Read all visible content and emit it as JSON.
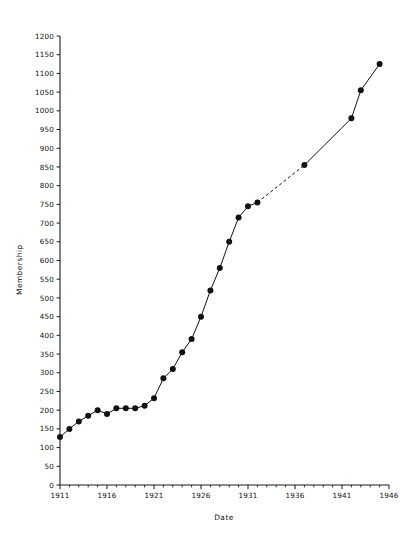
{
  "chart_data": {
    "type": "line",
    "title": "",
    "xlabel": "Date",
    "ylabel": "Membership",
    "xlim": [
      1911,
      1946
    ],
    "ylim": [
      0,
      1200
    ],
    "grid": false,
    "legend": null,
    "x_tick_step_major": 5,
    "x_tick_step_minor": 1,
    "y_tick_step_major": 50,
    "x_tick_labels": [
      "1911",
      "1916",
      "1921",
      "1926",
      "1931",
      "1936",
      "1941",
      "1946"
    ],
    "y_tick_labels": [
      "0",
      "50",
      "100",
      "150",
      "200",
      "250",
      "300",
      "350",
      "400",
      "450",
      "500",
      "550",
      "600",
      "650",
      "700",
      "750",
      "800",
      "850",
      "900",
      "950",
      "1000",
      "1050",
      "1100",
      "1150",
      "1200"
    ],
    "marker": "filled-circle",
    "line_color": "#111111",
    "marker_color": "#111111",
    "series": [
      {
        "name": "Membership",
        "x": [
          1911,
          1912,
          1913,
          1914,
          1915,
          1916,
          1917,
          1918,
          1919,
          1920,
          1921,
          1922,
          1923,
          1924,
          1925,
          1926,
          1927,
          1928,
          1929,
          1930,
          1931,
          1932,
          1937,
          1942,
          1943,
          1945
        ],
        "values": [
          128,
          150,
          170,
          185,
          200,
          190,
          205,
          205,
          205,
          212,
          232,
          285,
          310,
          355,
          390,
          450,
          520,
          580,
          650,
          715,
          745,
          755,
          855,
          980,
          1055,
          1125
        ],
        "dashed_segment": {
          "from_x": 1932,
          "to_x": 1937,
          "note": "gap in record shown as dashed line"
        }
      }
    ]
  },
  "axes": {
    "y_axis_title": "Membership",
    "x_axis_title": "Date"
  }
}
